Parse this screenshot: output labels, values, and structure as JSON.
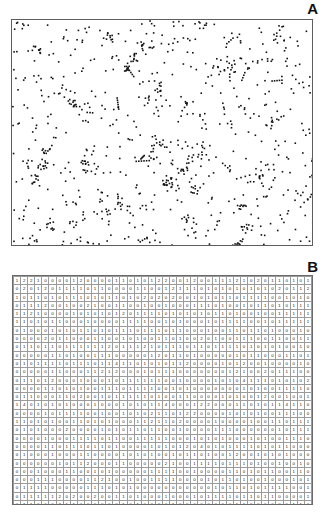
{
  "figure": {
    "panels": [
      {
        "letter": "A",
        "kind": "point-pattern-scatter"
      },
      {
        "letter": "B",
        "kind": "quadrat-count-grid"
      }
    ]
  },
  "chart_data": [
    {
      "type": "scatter",
      "title": "A",
      "xlabel": "",
      "ylabel": "",
      "xlim": [
        0,
        300
      ],
      "ylim": [
        0,
        225
      ],
      "grid": false,
      "legend": null,
      "marker": "square",
      "marker_color": "#111111",
      "marker_size_px": 1.6,
      "n_points": 880,
      "description": "Clustered spatial point pattern inside a rectangular plot frame; no axes ticks or labels are drawn.",
      "points_seed": 20240517
    },
    {
      "type": "heatmap",
      "title": "B",
      "xlabel": "",
      "ylabel": "",
      "grid": true,
      "legend": null,
      "description": "Quadrat counts of the panel A point pattern: 42 columns x 30 rows of integer counts drawn as text inside each cell.",
      "n_cols": 42,
      "n_rows": 30,
      "value_range": [
        0,
        4
      ],
      "values": [
        [
          1,
          2,
          2,
          1,
          0,
          0,
          0,
          0,
          1,
          2,
          0,
          0,
          0,
          0,
          1,
          1,
          0,
          1,
          0,
          1,
          2,
          2,
          0,
          0,
          1,
          2,
          0,
          0,
          1,
          1,
          1,
          2,
          1,
          0,
          2,
          0,
          1,
          1,
          0,
          1,
          0,
          1
        ],
        [
          0,
          2,
          0,
          1,
          2,
          0,
          1,
          1,
          1,
          1,
          0,
          1,
          1,
          0,
          0,
          0,
          0,
          1,
          1,
          0,
          0,
          1,
          2,
          1,
          1,
          1,
          0,
          1,
          0,
          1,
          0,
          1,
          0,
          1,
          0,
          1,
          0,
          2,
          0,
          1,
          1,
          2
        ],
        [
          1,
          0,
          1,
          1,
          0,
          1,
          0,
          1,
          1,
          1,
          0,
          1,
          0,
          1,
          1,
          0,
          1,
          0,
          2,
          0,
          2,
          0,
          2,
          0,
          0,
          1,
          0,
          1,
          0,
          1,
          1,
          0,
          1,
          1,
          1,
          1,
          0,
          0,
          1,
          0,
          1,
          0
        ],
        [
          0,
          1,
          1,
          1,
          2,
          0,
          0,
          1,
          0,
          0,
          2,
          1,
          0,
          0,
          1,
          1,
          0,
          0,
          1,
          0,
          0,
          1,
          0,
          0,
          0,
          1,
          1,
          1,
          0,
          1,
          0,
          0,
          1,
          0,
          1,
          1,
          0,
          1,
          0,
          1,
          1,
          1
        ],
        [
          1,
          1,
          2,
          1,
          0,
          0,
          0,
          0,
          1,
          0,
          1,
          0,
          1,
          0,
          1,
          2,
          0,
          1,
          1,
          1,
          1,
          0,
          1,
          0,
          1,
          0,
          1,
          0,
          1,
          1,
          0,
          1,
          0,
          0,
          1,
          0,
          0,
          1,
          1,
          1,
          1,
          1
        ],
        [
          1,
          1,
          0,
          1,
          0,
          1,
          1,
          0,
          0,
          0,
          1,
          0,
          0,
          0,
          0,
          1,
          1,
          1,
          1,
          0,
          0,
          1,
          0,
          1,
          0,
          0,
          0,
          1,
          0,
          1,
          1,
          1,
          1,
          0,
          0,
          1,
          0,
          1,
          1,
          1,
          1,
          1
        ],
        [
          0,
          1,
          0,
          0,
          0,
          1,
          0,
          1,
          0,
          1,
          1,
          0,
          1,
          0,
          1,
          1,
          1,
          0,
          1,
          1,
          1,
          0,
          1,
          1,
          0,
          0,
          0,
          1,
          0,
          0,
          1,
          1,
          0,
          1,
          1,
          0,
          1,
          0,
          0,
          0,
          1,
          0
        ],
        [
          0,
          0,
          0,
          0,
          2,
          0,
          1,
          1,
          0,
          0,
          0,
          1,
          1,
          0,
          0,
          1,
          0,
          1,
          0,
          0,
          1,
          1,
          0,
          1,
          0,
          0,
          2,
          0,
          1,
          0,
          0,
          1,
          1,
          1,
          0,
          0,
          1,
          1,
          0,
          0,
          1,
          1
        ],
        [
          0,
          1,
          1,
          0,
          1,
          1,
          0,
          1,
          1,
          1,
          1,
          1,
          1,
          2,
          0,
          1,
          1,
          1,
          2,
          1,
          0,
          1,
          1,
          1,
          0,
          1,
          1,
          0,
          1,
          1,
          1,
          1,
          0,
          1,
          0,
          1,
          0,
          1,
          0,
          0,
          1,
          0
        ],
        [
          0,
          0,
          0,
          0,
          0,
          1,
          1,
          0,
          1,
          0,
          0,
          1,
          1,
          1,
          0,
          0,
          0,
          0,
          0,
          1,
          2,
          0,
          1,
          1,
          0,
          1,
          0,
          0,
          0,
          0,
          0,
          1,
          0,
          1,
          1,
          0,
          0,
          0,
          1,
          1,
          0,
          1
        ],
        [
          0,
          1,
          0,
          1,
          1,
          1,
          1,
          0,
          1,
          1,
          1,
          0,
          1,
          1,
          4,
          1,
          1,
          0,
          1,
          0,
          1,
          0,
          1,
          1,
          2,
          0,
          0,
          0,
          0,
          1,
          0,
          1,
          2,
          0,
          0,
          1,
          0,
          0,
          0,
          0,
          1,
          0
        ],
        [
          0,
          0,
          0,
          0,
          0,
          1,
          1,
          0,
          0,
          0,
          1,
          1,
          2,
          1,
          2,
          0,
          0,
          0,
          1,
          0,
          1,
          1,
          1,
          0,
          0,
          0,
          0,
          0,
          0,
          0,
          1,
          2,
          1,
          0,
          0,
          2,
          0,
          1,
          1,
          1,
          0,
          0
        ],
        [
          0,
          1,
          1,
          0,
          1,
          2,
          0,
          0,
          0,
          1,
          0,
          0,
          0,
          1,
          0,
          1,
          1,
          1,
          1,
          1,
          1,
          0,
          0,
          1,
          0,
          0,
          0,
          0,
          1,
          0,
          1,
          0,
          4,
          1,
          1,
          1,
          0,
          1,
          0,
          1,
          0,
          2
        ],
        [
          0,
          0,
          0,
          0,
          1,
          1,
          0,
          1,
          0,
          1,
          0,
          0,
          1,
          1,
          1,
          0,
          1,
          1,
          1,
          1,
          0,
          0,
          1,
          0,
          1,
          0,
          0,
          0,
          0,
          0,
          0,
          0,
          1,
          0,
          1,
          0,
          0,
          1,
          1,
          1,
          1,
          0
        ],
        [
          0,
          1,
          1,
          0,
          0,
          0,
          1,
          1,
          0,
          2,
          0,
          0,
          1,
          0,
          1,
          1,
          1,
          1,
          1,
          0,
          1,
          0,
          0,
          1,
          1,
          0,
          0,
          0,
          0,
          1,
          0,
          1,
          0,
          0,
          1,
          2,
          0,
          0,
          1,
          0,
          0,
          1
        ],
        [
          1,
          4,
          0,
          1,
          0,
          1,
          0,
          1,
          0,
          0,
          0,
          1,
          0,
          0,
          0,
          1,
          0,
          1,
          0,
          1,
          1,
          4,
          0,
          0,
          0,
          1,
          2,
          2,
          0,
          0,
          0,
          1,
          1,
          0,
          1,
          0,
          1,
          1,
          4,
          1,
          1,
          0
        ],
        [
          0,
          0,
          0,
          0,
          1,
          0,
          1,
          1,
          1,
          1,
          0,
          0,
          1,
          0,
          0,
          1,
          0,
          1,
          0,
          2,
          1,
          1,
          0,
          1,
          2,
          2,
          0,
          0,
          0,
          0,
          1,
          0,
          1,
          0,
          1,
          0,
          0,
          1,
          1,
          1,
          0,
          0
        ],
        [
          1,
          1,
          0,
          1,
          0,
          1,
          0,
          0,
          1,
          1,
          0,
          1,
          0,
          1,
          0,
          0,
          0,
          1,
          1,
          2,
          1,
          1,
          0,
          2,
          0,
          0,
          0,
          0,
          1,
          0,
          0,
          0,
          0,
          1,
          0,
          0,
          1,
          1,
          0,
          1,
          1,
          1
        ],
        [
          0,
          1,
          0,
          1,
          0,
          0,
          0,
          2,
          0,
          0,
          0,
          0,
          1,
          0,
          1,
          0,
          1,
          1,
          0,
          1,
          1,
          0,
          0,
          1,
          0,
          0,
          0,
          0,
          1,
          1,
          1,
          0,
          0,
          0,
          0,
          0,
          0,
          1,
          0,
          1,
          1,
          1
        ],
        [
          0,
          0,
          0,
          0,
          1,
          0,
          0,
          0,
          1,
          1,
          1,
          1,
          0,
          1,
          1,
          0,
          0,
          1,
          1,
          1,
          1,
          1,
          0,
          0,
          0,
          1,
          0,
          1,
          0,
          1,
          0,
          0,
          0,
          1,
          0,
          1,
          0,
          0,
          1,
          1,
          1,
          0
        ],
        [
          0,
          0,
          0,
          0,
          1,
          1,
          0,
          1,
          1,
          1,
          0,
          1,
          1,
          0,
          1,
          0,
          0,
          0,
          0,
          1,
          0,
          1,
          0,
          1,
          2,
          0,
          4,
          0,
          1,
          0,
          1,
          1,
          1,
          1,
          0,
          1,
          0,
          1,
          1,
          0,
          0,
          0
        ],
        [
          0,
          1,
          0,
          0,
          0,
          1,
          0,
          0,
          0,
          1,
          1,
          0,
          0,
          0,
          0,
          1,
          0,
          1,
          0,
          1,
          0,
          0,
          1,
          0,
          1,
          1,
          0,
          1,
          0,
          0,
          1,
          2,
          0,
          0,
          1,
          0,
          1,
          0,
          1,
          0,
          0,
          0
        ],
        [
          0,
          0,
          0,
          0,
          0,
          0,
          1,
          0,
          1,
          1,
          2,
          0,
          0,
          0,
          1,
          1,
          0,
          0,
          0,
          0,
          0,
          2,
          1,
          0,
          0,
          1,
          1,
          1,
          1,
          0,
          1,
          1,
          1,
          0,
          1,
          0,
          0,
          1,
          0,
          0,
          1,
          0
        ],
        [
          0,
          0,
          0,
          1,
          0,
          0,
          0,
          1,
          1,
          0,
          0,
          1,
          0,
          1,
          0,
          0,
          0,
          0,
          0,
          1,
          1,
          1,
          1,
          0,
          0,
          1,
          0,
          0,
          0,
          0,
          1,
          1,
          0,
          1,
          0,
          1,
          1,
          0,
          0,
          1,
          1,
          0
        ],
        [
          0,
          0,
          0,
          1,
          1,
          1,
          0,
          0,
          0,
          0,
          1,
          1,
          2,
          1,
          0,
          0,
          1,
          0,
          0,
          1,
          1,
          1,
          1,
          0,
          0,
          0,
          0,
          1,
          0,
          1,
          1,
          0,
          1,
          0,
          0,
          1,
          0,
          0,
          0,
          1,
          0,
          1
        ],
        [
          0,
          1,
          1,
          1,
          1,
          0,
          0,
          0,
          0,
          0,
          1,
          1,
          1,
          0,
          1,
          0,
          1,
          0,
          0,
          0,
          0,
          0,
          0,
          0,
          0,
          0,
          0,
          0,
          1,
          0,
          1,
          1,
          0,
          1,
          0,
          1,
          1,
          1,
          1,
          0,
          0,
          1
        ],
        [
          0,
          1,
          1,
          1,
          1,
          1,
          2,
          0,
          2,
          0,
          0,
          2,
          0,
          0,
          1,
          1,
          0,
          1,
          0,
          0,
          0,
          1,
          0,
          0,
          0,
          1,
          0,
          1,
          1,
          1,
          1,
          0,
          1,
          1,
          0,
          1,
          1,
          0,
          0,
          0,
          0,
          1
        ],
        [
          0,
          1,
          1,
          0,
          0,
          0,
          2,
          1,
          1,
          0,
          0,
          0,
          0,
          0,
          0,
          1,
          0,
          1,
          0,
          0,
          0,
          0,
          1,
          0,
          0,
          0,
          0,
          0,
          0,
          0,
          0,
          1,
          1,
          0,
          0,
          0,
          0,
          0,
          0,
          1,
          1,
          0
        ],
        [
          0,
          0,
          0,
          0,
          0,
          0,
          0,
          0,
          0,
          0,
          0,
          0,
          0,
          0,
          0,
          0,
          0,
          0,
          0,
          1,
          1,
          0,
          0,
          1,
          0,
          0,
          0,
          0,
          0,
          0,
          0,
          0,
          0,
          1,
          1,
          1,
          1,
          0,
          0,
          0,
          0,
          0
        ],
        [
          1,
          0,
          0,
          0,
          1,
          2,
          0,
          0,
          0,
          0,
          0,
          1,
          0,
          0,
          0,
          1,
          1,
          1,
          1,
          2,
          0,
          0,
          0,
          0,
          0,
          0,
          0,
          0,
          0,
          1,
          0,
          0,
          0,
          0,
          0,
          1,
          1,
          0,
          2,
          1,
          0,
          0
        ]
      ]
    }
  ]
}
